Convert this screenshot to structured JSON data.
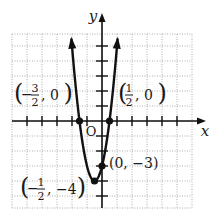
{
  "chart_data": {
    "type": "line",
    "title": "",
    "function": "y = 4x^2 + 4x - 3",
    "xlabel": "x",
    "ylabel": "y",
    "xlim": [
      -6,
      6
    ],
    "ylim": [
      -5.8,
      5.8
    ],
    "grid": true,
    "tick_step": 1,
    "origin_label": "O",
    "points": [
      {
        "x": -1.5,
        "y": 0,
        "label_parts": [
          "(",
          "−",
          "3",
          "2",
          ", 0",
          ")"
        ],
        "label": "(-3/2, 0)"
      },
      {
        "x": 0.5,
        "y": 0,
        "label_parts": [
          "(",
          "",
          "1",
          "2",
          ", 0",
          ")"
        ],
        "label": "(1/2, 0)"
      },
      {
        "x": 0,
        "y": -3,
        "label": "(0, −3)"
      },
      {
        "x": -0.5,
        "y": -4,
        "label_parts": [
          "(",
          "−",
          "1",
          "2",
          ", −4",
          ")"
        ],
        "label": "(-1/2, -4)"
      }
    ],
    "curve_domain": [
      -2.04,
      1.04
    ],
    "colors": {
      "curve": "#111111",
      "grid": "#9a9a9a",
      "axis": "#111111"
    }
  }
}
